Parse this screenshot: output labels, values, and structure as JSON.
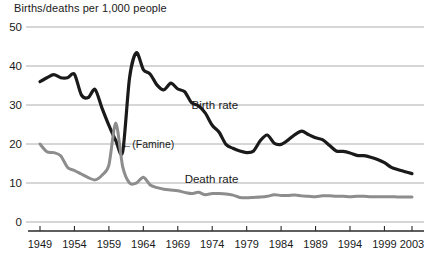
{
  "chart_data": {
    "type": "line",
    "title": "Births/deaths per 1,000 people",
    "xlabel": "",
    "ylabel": "",
    "ylim": [
      0,
      50
    ],
    "xlim": [
      1949,
      2003
    ],
    "yticks": [
      "0",
      "10",
      "20",
      "30",
      "40",
      "50"
    ],
    "ytick_values": [
      0,
      10,
      20,
      30,
      40,
      50
    ],
    "xticks": [
      "1949",
      "1954",
      "1959",
      "1964",
      "1969",
      "1974",
      "1979",
      "1984",
      "1989",
      "1994",
      "1999",
      "2003"
    ],
    "xtick_values": [
      1949,
      1954,
      1959,
      1964,
      1969,
      1974,
      1979,
      1984,
      1989,
      1994,
      1999,
      2003
    ],
    "grid": true,
    "legend_position": "inline-labels",
    "annotations": [
      {
        "text": "←(Famine)",
        "x": 1960,
        "y": 20,
        "name": "famine-annotation"
      }
    ],
    "x": [
      1949,
      1950,
      1951,
      1952,
      1953,
      1954,
      1955,
      1956,
      1957,
      1958,
      1959,
      1960,
      1961,
      1962,
      1963,
      1964,
      1965,
      1966,
      1967,
      1968,
      1969,
      1970,
      1971,
      1972,
      1973,
      1974,
      1975,
      1976,
      1977,
      1978,
      1979,
      1980,
      1981,
      1982,
      1983,
      1984,
      1985,
      1986,
      1987,
      1988,
      1989,
      1990,
      1991,
      1992,
      1993,
      1994,
      1995,
      1996,
      1997,
      1998,
      1999,
      2000,
      2001,
      2002,
      2003
    ],
    "series": [
      {
        "name": "Birth rate",
        "color": "#1a1a1a",
        "label_x": 1971,
        "label_y": 30,
        "values": [
          36.0,
          37.0,
          37.8,
          37.0,
          37.0,
          37.9,
          32.6,
          31.9,
          34.0,
          29.2,
          24.8,
          20.9,
          18.0,
          37.0,
          43.4,
          39.1,
          37.9,
          35.1,
          33.9,
          35.6,
          34.1,
          33.4,
          30.6,
          29.8,
          27.9,
          24.8,
          23.0,
          19.9,
          18.9,
          18.2,
          17.8,
          18.2,
          20.9,
          22.3,
          20.2,
          19.9,
          21.0,
          22.4,
          23.3,
          22.4,
          21.6,
          21.1,
          19.7,
          18.2,
          18.1,
          17.7,
          17.1,
          17.0,
          16.6,
          16.0,
          15.2,
          14.0,
          13.4,
          12.9,
          12.4
        ]
      },
      {
        "name": "Death rate",
        "color": "#8d8d8d",
        "label_x": 1970,
        "label_y": 11,
        "values": [
          20.0,
          18.0,
          17.8,
          17.0,
          14.0,
          13.2,
          12.3,
          11.4,
          10.8,
          12.0,
          14.6,
          25.4,
          14.2,
          10.0,
          10.0,
          11.5,
          9.5,
          8.8,
          8.4,
          8.2,
          8.0,
          7.6,
          7.3,
          7.6,
          7.0,
          7.3,
          7.3,
          7.2,
          6.9,
          6.3,
          6.2,
          6.3,
          6.4,
          6.6,
          7.0,
          6.8,
          6.8,
          6.9,
          6.7,
          6.6,
          6.5,
          6.7,
          6.7,
          6.6,
          6.6,
          6.5,
          6.6,
          6.6,
          6.5,
          6.5,
          6.5,
          6.5,
          6.4,
          6.4,
          6.4
        ]
      }
    ]
  }
}
